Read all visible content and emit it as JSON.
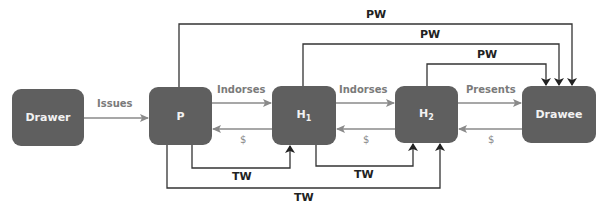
{
  "nodes": {
    "drawer": {
      "label": "Drawer"
    },
    "payee": {
      "label": "P"
    },
    "holder1": {
      "label": "H",
      "sub": "1"
    },
    "holder2": {
      "label": "H",
      "sub": "2"
    },
    "drawee": {
      "label": "Drawee"
    }
  },
  "edges": {
    "issues": "Issues",
    "indorses1": "Indorses",
    "indorses2": "Indorses",
    "presents": "Presents",
    "pay1": "$",
    "pay2": "$",
    "pay3": "$",
    "pw_top": "PW",
    "pw_mid": "PW",
    "pw_low": "PW",
    "tw_left": "TW",
    "tw_right": "TW",
    "tw_outer": "TW"
  },
  "colors": {
    "node_fill": "#5f5f5f",
    "node_text": "#f2f2f2",
    "flow_arrow": "#8a8a8a",
    "frame_line": "#333333"
  }
}
